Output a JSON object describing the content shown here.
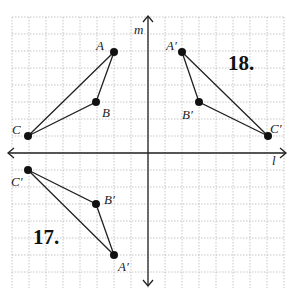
{
  "diagram": {
    "axes": {
      "horizontal_label": "l",
      "vertical_label": "m"
    },
    "grid": {
      "origin_px": [
        148,
        153
      ],
      "spacing_px": 17,
      "x_range": [
        -8,
        8
      ],
      "y_range": [
        -8,
        8
      ]
    },
    "problems": [
      {
        "number": "18.",
        "original": [
          {
            "name": "A",
            "x": -2,
            "y": 6
          },
          {
            "name": "B",
            "x": -3,
            "y": 3
          },
          {
            "name": "C",
            "x": -7,
            "y": 1
          }
        ],
        "image": [
          {
            "name": "A′",
            "x": 2,
            "y": 6
          },
          {
            "name": "B′",
            "x": 3,
            "y": 3
          },
          {
            "name": "C′",
            "x": 7,
            "y": 1
          }
        ]
      },
      {
        "number": "17.",
        "image": [
          {
            "name": "C′",
            "x": -7,
            "y": -1
          },
          {
            "name": "B′",
            "x": -3,
            "y": -3
          },
          {
            "name": "A′",
            "x": -2,
            "y": -6
          }
        ]
      }
    ],
    "labels": {
      "A": "A",
      "B": "B",
      "C": "C",
      "A18": "A′",
      "B18": "B′",
      "C18": "C′",
      "A17": "A′",
      "B17": "B′",
      "C17": "C′",
      "num17": "17.",
      "num18": "18.",
      "l": "l",
      "m": "m"
    }
  }
}
